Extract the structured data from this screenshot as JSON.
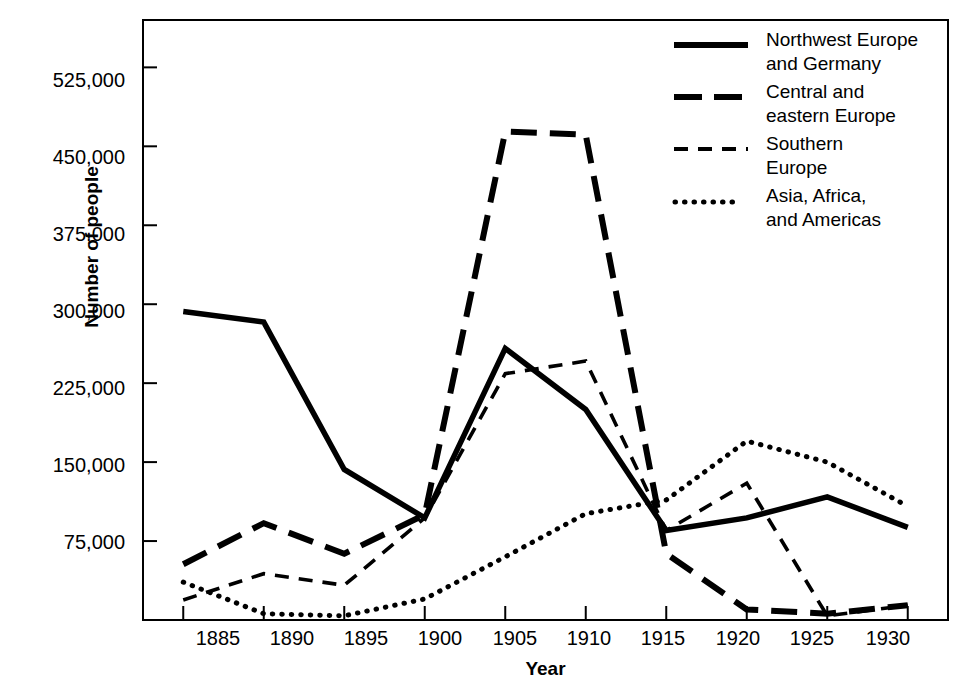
{
  "chart_data": {
    "type": "line",
    "title": "",
    "xlabel": "Year",
    "ylabel": "Number of people",
    "x": [
      1885,
      1890,
      1895,
      1900,
      1905,
      1910,
      1915,
      1920,
      1925,
      1930
    ],
    "xtick_labels": [
      "1885",
      "1890",
      "1895",
      "1900",
      "1905",
      "1910",
      "1915",
      "1920",
      "1925",
      "1930"
    ],
    "ytick_labels": [
      "525,000",
      "450,000",
      "375,000",
      "300,000",
      "225,000",
      "150,000",
      "75,000"
    ],
    "ytick_values": [
      525000,
      450000,
      375000,
      300000,
      225000,
      150000,
      75000
    ],
    "xlim": [
      1882.5,
      1932.5
    ],
    "ylim": [
      0,
      570000
    ],
    "grid": false,
    "legend_position": "top-right",
    "series": [
      {
        "name": "Northwest Europe and Germany",
        "style": "solid",
        "values": [
          293000,
          283000,
          143000,
          97000,
          258000,
          200000,
          85000,
          97000,
          117000,
          88000
        ]
      },
      {
        "name": "Central and eastern Europe",
        "style": "long-dash",
        "values": [
          53000,
          92000,
          63000,
          100000,
          464000,
          461000,
          63000,
          10000,
          6000,
          14000
        ]
      },
      {
        "name": "Southern Europe",
        "style": "short-dash",
        "values": [
          19000,
          44000,
          33000,
          97000,
          234000,
          246000,
          85000,
          130000,
          4000,
          14000
        ]
      },
      {
        "name": "Asia, Africa, and Americas",
        "style": "dotted",
        "values": [
          36000,
          6000,
          4000,
          20000,
          60000,
          101000,
          114000,
          170000,
          150000,
          108000
        ]
      }
    ]
  },
  "legend": {
    "items": [
      {
        "label": "Northwest Europe\nand Germany",
        "line1": "Northwest Europe",
        "line2": "and Germany",
        "style": "solid"
      },
      {
        "label": "Central and\neastern Europe",
        "line1": "Central and",
        "line2": "eastern Europe",
        "style": "long-dash"
      },
      {
        "label": "Southern\nEurope",
        "line1": "Southern",
        "line2": "Europe",
        "style": "short-dash"
      },
      {
        "label": "Asia, Africa,\nand Americas",
        "line1": "Asia, Africa,",
        "line2": "and Americas",
        "style": "dotted"
      }
    ]
  },
  "colors": {
    "ink": "#000000",
    "background": "#ffffff"
  }
}
